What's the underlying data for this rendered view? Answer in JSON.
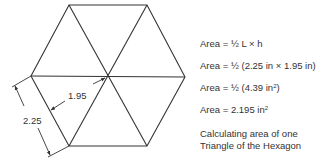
{
  "diagram": {
    "colors": {
      "line": "#333333",
      "text": "#333333",
      "background": "#ffffff"
    },
    "vertices": {
      "top_left": [
        69,
        5
      ],
      "top_right": [
        147,
        5
      ],
      "right": [
        185,
        77
      ],
      "bottom_right": [
        147,
        146
      ],
      "bottom_left": [
        69,
        146
      ],
      "left": [
        31,
        76
      ],
      "center": [
        107,
        77
      ]
    },
    "dimensions": {
      "side_length": {
        "label": "2.25"
      },
      "height": {
        "label": "1.95"
      }
    }
  },
  "equations": [
    {
      "lhs": "Area",
      "rhs": "½ L × h",
      "sup": ""
    },
    {
      "lhs": "Area",
      "rhs": "½ (2.25 in × 1.95 in)",
      "sup": ""
    },
    {
      "lhs": "Area",
      "rhs": "½ (4.39 in",
      "sup": "2",
      "tail": ")"
    },
    {
      "lhs": "Area",
      "rhs": "2.195 in",
      "sup": "2",
      "tail": ""
    }
  ],
  "caption": {
    "line1": "Calculating area of one",
    "line2": "Triangle of the Hexagon"
  }
}
